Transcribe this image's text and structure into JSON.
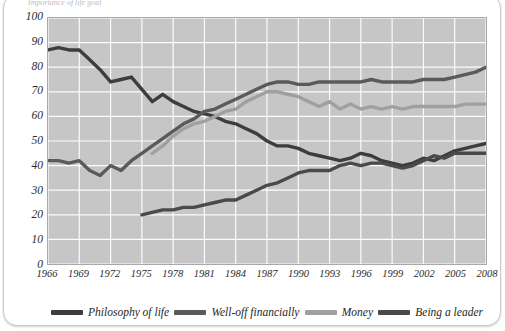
{
  "card": {
    "cropped_title": "Importance of life goal"
  },
  "chart_data": {
    "type": "line",
    "title": "",
    "xlabel": "",
    "ylabel": "",
    "xlim": [
      1966,
      2008
    ],
    "ylim": [
      0,
      100
    ],
    "grid": true,
    "legend_position": "bottom",
    "x_ticks": [
      "1966",
      "1969",
      "1972",
      "1975",
      "1978",
      "1981",
      "1984",
      "1987",
      "1990",
      "1993",
      "1996",
      "1999",
      "2002",
      "2005",
      "2008"
    ],
    "y_ticks": [
      "0",
      "10",
      "20",
      "30",
      "40",
      "50",
      "60",
      "70",
      "80",
      "90",
      "100"
    ],
    "x": [
      1966,
      1967,
      1968,
      1969,
      1970,
      1971,
      1972,
      1973,
      1974,
      1975,
      1976,
      1977,
      1978,
      1979,
      1980,
      1981,
      1982,
      1983,
      1984,
      1985,
      1986,
      1987,
      1988,
      1989,
      1990,
      1991,
      1992,
      1993,
      1994,
      1995,
      1996,
      1997,
      1998,
      1999,
      2000,
      2001,
      2002,
      2003,
      2004,
      2005,
      2006,
      2007,
      2008
    ],
    "series": [
      {
        "name": "Philosophy of life",
        "color": "#3d3d3d",
        "width": 3.4,
        "values": [
          87,
          88,
          87,
          87,
          83,
          79,
          74,
          75,
          76,
          71,
          66,
          69,
          66,
          64,
          62,
          61,
          60,
          58,
          57,
          55,
          53,
          50,
          48,
          48,
          47,
          45,
          44,
          43,
          42,
          43,
          45,
          44,
          42,
          41,
          40,
          41,
          43,
          42,
          44,
          46,
          47,
          48,
          49
        ]
      },
      {
        "name": "Well-off financially",
        "color": "#5a5a5a",
        "width": 3.4,
        "values": [
          42,
          42,
          41,
          42,
          38,
          36,
          40,
          38,
          42,
          45,
          48,
          51,
          54,
          57,
          59,
          62,
          63,
          65,
          67,
          69,
          71,
          73,
          74,
          74,
          73,
          73,
          74,
          74,
          74,
          74,
          74,
          75,
          74,
          74,
          74,
          74,
          75,
          75,
          75,
          76,
          77,
          78,
          80
        ]
      },
      {
        "name": "Money",
        "color": "#a0a0a0",
        "width": 3.4,
        "start_year": 1976,
        "values": [
          null,
          null,
          null,
          null,
          null,
          null,
          null,
          null,
          null,
          null,
          45,
          48,
          52,
          55,
          57,
          58,
          60,
          62,
          63,
          66,
          68,
          70,
          70,
          69,
          68,
          66,
          64,
          66,
          63,
          65,
          63,
          64,
          63,
          64,
          63,
          64,
          64,
          64,
          64,
          64,
          65,
          65,
          65
        ]
      },
      {
        "name": "Being a leader",
        "color": "#4a4a4a",
        "width": 3.4,
        "start_year": 1975,
        "values": [
          null,
          null,
          null,
          null,
          null,
          null,
          null,
          null,
          null,
          20,
          21,
          22,
          22,
          23,
          23,
          24,
          25,
          26,
          26,
          28,
          30,
          32,
          33,
          35,
          37,
          38,
          38,
          38,
          40,
          41,
          40,
          41,
          41,
          40,
          39,
          40,
          42,
          44,
          43,
          45,
          45,
          45,
          45
        ]
      }
    ]
  },
  "legend": {
    "items": [
      {
        "label": "Philosophy of life",
        "color": "#3d3d3d"
      },
      {
        "label": "Well-off financially",
        "color": "#5a5a5a"
      },
      {
        "label": "Money",
        "color": "#a0a0a0"
      },
      {
        "label": "Being a leader",
        "color": "#4a4a4a"
      }
    ]
  }
}
